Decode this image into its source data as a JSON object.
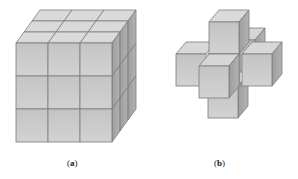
{
  "figure": {
    "panels": [
      {
        "id": "a",
        "caption_open": "(",
        "caption_letter": "a",
        "caption_close": ")",
        "description": "3x3x3 cube assembled from 27 unit cubes"
      },
      {
        "id": "b",
        "caption_open": "(",
        "caption_letter": "b",
        "caption_close": ")",
        "description": "3D cross made of 7 unit cubes (center plus six neighbors)"
      }
    ],
    "colors": {
      "front": "#c8c8c8",
      "top": "#dcdcdc",
      "side": "#a9a9a9",
      "edge": "#7a7a7a"
    }
  }
}
